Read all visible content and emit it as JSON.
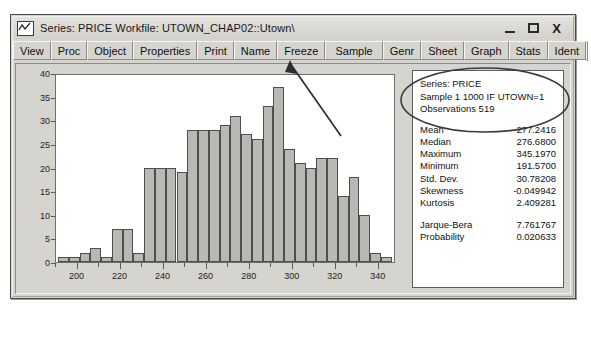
{
  "window": {
    "title": "Series: PRICE  Workfile: UTOWN_CHAP02::Utown\\",
    "icon": "series-line-icon",
    "controls": {
      "minimize": "minimize-button",
      "maximize": "maximize-button",
      "close": "X"
    }
  },
  "toolbar": {
    "group1": [
      "View",
      "Proc",
      "Object",
      "Properties"
    ],
    "group2": [
      "Print",
      "Name",
      "Freeze"
    ],
    "group3": [
      "Sample",
      "Genr",
      "Sheet",
      "Graph",
      "Stats",
      "Ident"
    ],
    "highlighted": "Sample"
  },
  "stats": {
    "header": [
      "Series: PRICE",
      "Sample 1 1000 IF UTOWN=1",
      "Observations 519"
    ],
    "rows": [
      {
        "label": "Mean",
        "value": "277.2416"
      },
      {
        "label": "Median",
        "value": "276.6800"
      },
      {
        "label": "Maximum",
        "value": "345.1970"
      },
      {
        "label": "Minimum",
        "value": "191.5700"
      },
      {
        "label": "Std. Dev.",
        "value": "30.78208"
      },
      {
        "label": "Skewness",
        "value": "-0.049942"
      },
      {
        "label": "Kurtosis",
        "value": "2.409281"
      }
    ],
    "rows2": [
      {
        "label": "Jarque-Bera",
        "value": "7.761767"
      },
      {
        "label": "Probability",
        "value": "0.020633"
      }
    ]
  },
  "chart_data": {
    "type": "bar",
    "title": "",
    "xlabel": "",
    "ylabel": "",
    "grid": false,
    "legend": false,
    "ylim": [
      0,
      40
    ],
    "yticks": [
      0,
      5,
      10,
      15,
      20,
      25,
      30,
      35,
      40
    ],
    "xlim": [
      190,
      348
    ],
    "xticks": [
      200,
      220,
      240,
      260,
      280,
      300,
      320,
      340
    ],
    "xminor_step": 10,
    "bin_width": 5,
    "bin_starts": [
      191,
      196,
      201,
      206,
      211,
      216,
      221,
      226,
      231,
      236,
      241,
      246,
      251,
      256,
      261,
      266,
      271,
      276,
      281,
      286,
      291,
      296,
      301,
      306,
      311,
      316,
      321,
      326,
      331,
      336,
      341
    ],
    "values": [
      1,
      1,
      2,
      3,
      1,
      7,
      7,
      2,
      20,
      20,
      20,
      19,
      28,
      28,
      28,
      29,
      31,
      27,
      26,
      33,
      37,
      24,
      21,
      20,
      22,
      22,
      14,
      18,
      10,
      2,
      1
    ],
    "bar_fill": "#b9b8b3",
    "bar_stroke": "#4e4e4e"
  },
  "annotations": {
    "oval_target": "stats-header-oval",
    "arrow_from": "stats-header",
    "arrow_to": "Sample"
  },
  "colors": {
    "window_face": "#d6d4ce",
    "plot_bg": "#ffffff",
    "border": "#4a4a4a"
  }
}
